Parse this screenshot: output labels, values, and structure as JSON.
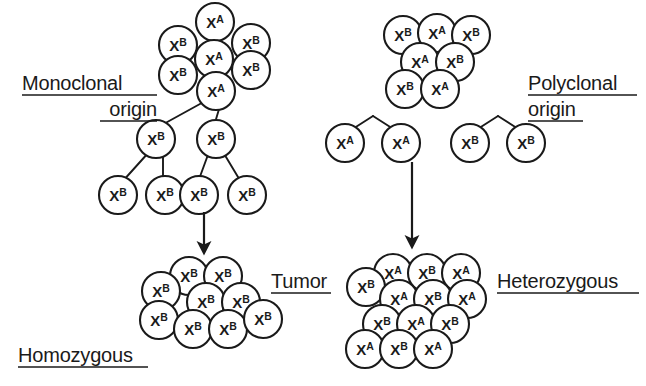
{
  "figure": {
    "width": 646,
    "height": 386,
    "background": "#ffffff",
    "stroke_color": "#1a1a1a"
  },
  "labels": {
    "monoclonal_line1": "Monoclonal",
    "monoclonal_line2": "origin",
    "polyclonal_line1": "Polyclonal",
    "polyclonal_line2": "origin",
    "tumor": "Tumor",
    "homozygous": "Homozygous",
    "heterozygous": "Heterozygous"
  },
  "allele_labels": {
    "a": "X",
    "a_sup": "A",
    "b": "X",
    "b_sup": "B"
  },
  "clusters": {
    "monoclonal_source": {
      "name": "normal-tissue-cluster-left",
      "count": 7,
      "cells": [
        {
          "x": 215,
          "y": 22,
          "allele": "A"
        },
        {
          "x": 178,
          "y": 43,
          "allele": "B"
        },
        {
          "x": 250,
          "y": 43,
          "allele": "B"
        },
        {
          "x": 214,
          "y": 62,
          "allele": "A"
        },
        {
          "x": 178,
          "y": 74,
          "allele": "B"
        },
        {
          "x": 250,
          "y": 68,
          "allele": "B"
        },
        {
          "x": 216,
          "y": 90,
          "allele": "A"
        }
      ]
    },
    "polyclonal_source": {
      "name": "normal-tissue-cluster-right",
      "count": 7,
      "cells": [
        {
          "x": 402,
          "y": 33,
          "allele": "B"
        },
        {
          "x": 437,
          "y": 33,
          "allele": "A"
        },
        {
          "x": 472,
          "y": 33,
          "allele": "B"
        },
        {
          "x": 419,
          "y": 61,
          "allele": "A"
        },
        {
          "x": 455,
          "y": 61,
          "allele": "B"
        },
        {
          "x": 404,
          "y": 88,
          "allele": "B"
        },
        {
          "x": 440,
          "y": 88,
          "allele": "A"
        }
      ]
    },
    "homozygous_tumor": {
      "name": "homozygous-tumor-cluster",
      "count": 9,
      "cells": [
        {
          "x": 188,
          "y": 275,
          "allele": "B"
        },
        {
          "x": 222,
          "y": 275,
          "allele": "B"
        },
        {
          "x": 161,
          "y": 290,
          "allele": "B"
        },
        {
          "x": 205,
          "y": 301,
          "allele": "B"
        },
        {
          "x": 240,
          "y": 301,
          "allele": "B"
        },
        {
          "x": 158,
          "y": 318,
          "allele": "B"
        },
        {
          "x": 192,
          "y": 327,
          "allele": "B"
        },
        {
          "x": 227,
          "y": 327,
          "allele": "B"
        },
        {
          "x": 262,
          "y": 318,
          "allele": "B"
        }
      ]
    },
    "heterozygous_tumor": {
      "name": "heterozygous-tumor-cluster",
      "count": 13,
      "cells": [
        {
          "x": 392,
          "y": 272,
          "allele": "A"
        },
        {
          "x": 426,
          "y": 272,
          "allele": "B"
        },
        {
          "x": 460,
          "y": 272,
          "allele": "A"
        },
        {
          "x": 365,
          "y": 286,
          "allele": "B"
        },
        {
          "x": 398,
          "y": 298,
          "allele": "A"
        },
        {
          "x": 432,
          "y": 298,
          "allele": "B"
        },
        {
          "x": 466,
          "y": 298,
          "allele": "A"
        },
        {
          "x": 381,
          "y": 323,
          "allele": "B"
        },
        {
          "x": 415,
          "y": 323,
          "allele": "A"
        },
        {
          "x": 449,
          "y": 323,
          "allele": "B"
        },
        {
          "x": 364,
          "y": 348,
          "allele": "A"
        },
        {
          "x": 398,
          "y": 348,
          "allele": "B"
        },
        {
          "x": 432,
          "y": 348,
          "allele": "A"
        }
      ]
    }
  },
  "lineage_trees": {
    "monoclonal": {
      "name": "monoclonal-lineage-tree",
      "root": {
        "x": 214,
        "y": 102
      },
      "level2": [
        {
          "x": 156,
          "y": 139,
          "allele": "B"
        },
        {
          "x": 215,
          "y": 139,
          "allele": "B"
        }
      ],
      "level3": [
        {
          "x": 118,
          "y": 194,
          "allele": "B"
        },
        {
          "x": 165,
          "y": 194,
          "allele": "B"
        },
        {
          "x": 196,
          "y": 194,
          "allele": "B"
        },
        {
          "x": 244,
          "y": 194,
          "allele": "B"
        }
      ],
      "edges": [
        {
          "from": {
            "x": 209,
            "y": 99
          },
          "to": {
            "x": 160,
            "y": 126
          }
        },
        {
          "from": {
            "x": 222,
            "y": 99
          },
          "to": {
            "x": 214,
            "y": 126
          }
        },
        {
          "from": {
            "x": 149,
            "y": 152
          },
          "to": {
            "x": 122,
            "y": 182
          }
        },
        {
          "from": {
            "x": 163,
            "y": 152
          },
          "to": {
            "x": 163,
            "y": 182
          }
        },
        {
          "from": {
            "x": 209,
            "y": 152
          },
          "to": {
            "x": 198,
            "y": 182
          }
        },
        {
          "from": {
            "x": 223,
            "y": 152
          },
          "to": {
            "x": 241,
            "y": 182
          }
        }
      ]
    },
    "polyclonal_left": {
      "name": "polyclonal-lineage-tree-left",
      "apex": {
        "x": 373,
        "y": 116
      },
      "children": [
        {
          "x": 345,
          "y": 140,
          "allele": "A"
        },
        {
          "x": 400,
          "y": 140,
          "allele": "A"
        }
      ],
      "edges": [
        {
          "from": {
            "x": 373,
            "y": 116
          },
          "to": {
            "x": 348,
            "y": 131
          }
        },
        {
          "from": {
            "x": 373,
            "y": 116
          },
          "to": {
            "x": 398,
            "y": 131
          }
        }
      ]
    },
    "polyclonal_right": {
      "name": "polyclonal-lineage-tree-right",
      "apex": {
        "x": 498,
        "y": 116
      },
      "children": [
        {
          "x": 470,
          "y": 140,
          "allele": "B"
        },
        {
          "x": 525,
          "y": 140,
          "allele": "B"
        }
      ],
      "edges": [
        {
          "from": {
            "x": 498,
            "y": 116
          },
          "to": {
            "x": 473,
            "y": 131
          }
        },
        {
          "from": {
            "x": 498,
            "y": 116
          },
          "to": {
            "x": 523,
            "y": 131
          }
        }
      ]
    }
  },
  "arrows": {
    "left": {
      "name": "monoclonal-to-tumor-arrow",
      "x": 204,
      "y_start": 212,
      "y_end": 252
    },
    "right": {
      "name": "polyclonal-to-tumor-arrow",
      "x": 412,
      "y_start": 160,
      "y_end": 245
    }
  },
  "label_positions": {
    "monoclonal_line1": {
      "x": 22,
      "y": 90,
      "underline_x1": 22,
      "underline_x2": 157
    },
    "monoclonal_line2": {
      "x": 94,
      "y": 115,
      "underline_x1": 94,
      "underline_x2": 157
    },
    "polyclonal_line1": {
      "x": 528,
      "y": 90,
      "underline_x1": 528,
      "underline_x2": 643
    },
    "polyclonal_line2": {
      "x": 528,
      "y": 115,
      "underline_x1": 528,
      "underline_x2": 583
    },
    "tumor": {
      "x": 271,
      "y": 288,
      "underline_x1": 271,
      "underline_x2": 330
    },
    "homozygous": {
      "x": 18,
      "y": 362,
      "underline_x1": 18,
      "underline_x2": 147
    },
    "heterozygous": {
      "x": 497,
      "y": 288,
      "underline_x1": 497,
      "underline_x2": 638
    }
  }
}
